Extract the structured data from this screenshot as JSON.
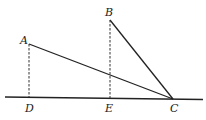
{
  "diagram": {
    "points": {
      "A": {
        "label": "A"
      },
      "B": {
        "label": "B"
      },
      "C": {
        "label": "C"
      },
      "D": {
        "label": "D"
      },
      "E": {
        "label": "E"
      }
    },
    "segments": [
      {
        "from": "A",
        "to": "C",
        "style": "solid"
      },
      {
        "from": "B",
        "to": "C",
        "style": "solid"
      },
      {
        "from": "A",
        "to": "D",
        "style": "dashed"
      },
      {
        "from": "B",
        "to": "E",
        "style": "dashed"
      }
    ],
    "baseline": {
      "through": [
        "D",
        "E",
        "C"
      ],
      "style": "solid"
    },
    "colors": {
      "line": "#222222",
      "background": "#ffffff"
    }
  }
}
